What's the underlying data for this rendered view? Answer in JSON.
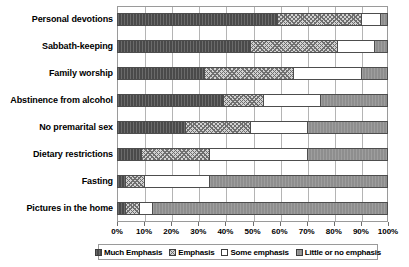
{
  "chart_data": {
    "type": "bar",
    "subtype": "stacked-horizontal-100-percent",
    "title": "",
    "xlabel": "",
    "ylabel": "",
    "xlim": [
      0,
      100
    ],
    "grid": true,
    "legend_position": "bottom",
    "categories": [
      "Personal devotions",
      "Sabbath-keeping",
      "Family worship",
      "Abstinence from alcohol",
      "No premarital sex",
      "Dietary restrictions",
      "Fasting",
      "Pictures in the home"
    ],
    "tick_labels": [
      "0%",
      "10%",
      "20%",
      "30%",
      "40%",
      "50%",
      "60%",
      "70%",
      "80%",
      "90%",
      "100%"
    ],
    "tick_values": [
      0,
      10,
      20,
      30,
      40,
      50,
      60,
      70,
      80,
      90,
      100
    ],
    "series": [
      {
        "name": "Much Emphasis",
        "color": "#4a4a4a",
        "pattern": "solid-dark",
        "values": [
          59,
          49,
          32,
          39,
          25,
          9,
          3,
          3
        ]
      },
      {
        "name": "Emphasis",
        "color": "#d2d2d2",
        "pattern": "crosshatch",
        "values": [
          31,
          32,
          33,
          15,
          24,
          25,
          7,
          5
        ]
      },
      {
        "name": "Some emphasis",
        "color": "#ffffff",
        "pattern": "empty",
        "values": [
          7,
          14,
          25,
          21,
          21,
          36,
          24,
          5
        ]
      },
      {
        "name": "Little or no emphasis",
        "color": "#8e8e8e",
        "pattern": "solid-mid",
        "values": [
          3,
          5,
          10,
          25,
          30,
          30,
          66,
          87
        ]
      }
    ]
  }
}
